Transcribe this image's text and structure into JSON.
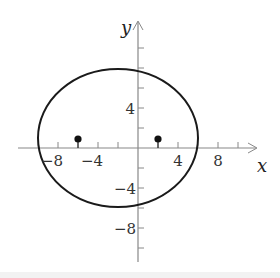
{
  "diagram": {
    "type": "ellipse-on-coordinate-plane",
    "x_axis_label": "x",
    "y_axis_label": "y",
    "x_tick_labels": [
      {
        "value": -8,
        "text": "−8"
      },
      {
        "value": -4,
        "text": "−4"
      },
      {
        "value": 4,
        "text": "4"
      },
      {
        "value": 8,
        "text": "8"
      }
    ],
    "y_tick_labels": [
      {
        "value": 4,
        "text": "4"
      },
      {
        "value": -4,
        "text": "−4"
      },
      {
        "value": -8,
        "text": "−8"
      }
    ],
    "x_ticks": [
      -8,
      -6,
      -4,
      -2,
      2,
      4,
      8,
      10
    ],
    "y_ticks": [
      10,
      8,
      6,
      4,
      2,
      -2,
      -4,
      -6,
      -8,
      -10
    ],
    "ellipse": {
      "center": [
        -2,
        1
      ],
      "semi_major_x": 8,
      "semi_minor_y": 6.93
    },
    "foci": [
      [
        -6,
        1
      ],
      [
        2,
        1
      ]
    ],
    "colors": {
      "curve": "#1a1a1a",
      "axis": "#888888",
      "point": "#111111"
    }
  }
}
